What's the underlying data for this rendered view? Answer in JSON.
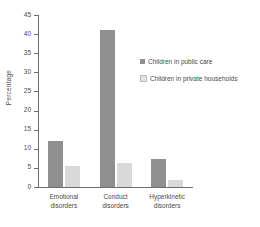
{
  "chart_data": {
    "type": "bar",
    "title": "",
    "xlabel": "",
    "ylabel": "Percentage",
    "ylim": [
      0,
      45
    ],
    "yticks": [
      0,
      5,
      10,
      15,
      20,
      25,
      30,
      35,
      40,
      45
    ],
    "ytick_labels": [
      "0",
      "5",
      "10",
      "15",
      "20",
      "25",
      "30",
      "35",
      "40",
      "45"
    ],
    "grid": false,
    "legend_position": "right",
    "categories": [
      "Emotional disorders",
      "Conduct disorders",
      "Hyperkinetic disorders"
    ],
    "category_lines": [
      [
        "Emotional",
        "disorders"
      ],
      [
        "Conduct",
        "disorders"
      ],
      [
        "Hyperkinetic",
        "disorders"
      ]
    ],
    "series": [
      {
        "name": "Children in public care",
        "color": "#8f8f8f",
        "values": [
          12,
          41,
          7.3
        ]
      },
      {
        "name": "Children in private households",
        "color": "#d9d9d9",
        "values": [
          5.5,
          6.2,
          1.8
        ]
      }
    ]
  },
  "legend": {
    "items": [
      {
        "label": "Children in public care",
        "swatch": "dark"
      },
      {
        "label": "Children in private households",
        "swatch": "light"
      }
    ]
  },
  "axis": {
    "ylabel": "Percentage"
  }
}
